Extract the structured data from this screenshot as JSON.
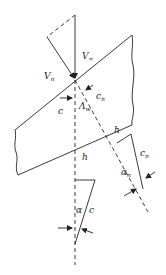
{
  "figure": {
    "colors": {
      "line": "#222222",
      "background": "#ffffff"
    }
  },
  "labels": {
    "v_inf": {
      "main": "V",
      "sub": "∞"
    },
    "v_n": {
      "main": "V",
      "sub": "n"
    },
    "c": "c",
    "c_n": {
      "main": "c",
      "sub": "n"
    },
    "lambda_w": {
      "main": "Λ",
      "sub": "w"
    },
    "h_upper": "h",
    "h_lower": "h",
    "c_n_small": {
      "main": "c",
      "sub": "n"
    },
    "alpha_n": {
      "main": "α",
      "sub": "n"
    },
    "alpha": "α",
    "c_small": "c"
  }
}
